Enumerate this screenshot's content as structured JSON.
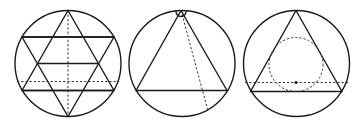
{
  "diagram": {
    "colors": {
      "stroke": "#1a1a1a",
      "background": "#ffffff"
    },
    "figures": [
      {
        "id": "hexagram-grid",
        "label": "Hexagram inscribed in circle with horizontal chords and dashed axes",
        "circle": {
          "cx": 68,
          "cy": 63.5,
          "r": 53
        },
        "up_triangle": [
          [
            68,
            10.5
          ],
          [
            22,
            90.5
          ],
          [
            114,
            90.5
          ]
        ],
        "down_triangle": [
          [
            68,
            116.5
          ],
          [
            22,
            37
          ],
          [
            114,
            37
          ]
        ],
        "solid_chords": [
          {
            "x1": 22,
            "y1": 37,
            "x2": 114,
            "y2": 37
          },
          {
            "x1": 38,
            "y1": 63.5,
            "x2": 98,
            "y2": 63.5
          },
          {
            "x1": 22,
            "y1": 90.5,
            "x2": 114,
            "y2": 90.5
          }
        ],
        "dashed_lines": [
          {
            "x1": 68,
            "y1": 10.5,
            "x2": 68,
            "y2": 116.5
          },
          {
            "x1": 17,
            "y1": 81.5,
            "x2": 119,
            "y2": 81.5
          }
        ]
      },
      {
        "id": "triangle-apex-angle",
        "label": "Triangle inscribed in circle with angle mark at apex and dashed line from apex",
        "circle": {
          "cx": 182,
          "cy": 63.5,
          "r": 53
        },
        "triangle": [
          [
            181,
            10.5
          ],
          [
            136,
            90.5
          ],
          [
            227,
            90.5
          ]
        ],
        "angle_mark": {
          "cx": 181,
          "cy": 10.5,
          "r": 5
        },
        "dashed_lines": [
          {
            "x1": 181,
            "y1": 10.5,
            "x2": 208,
            "y2": 111
          }
        ]
      },
      {
        "id": "triangle-incircle",
        "label": "Triangle inscribed in circle with dashed inscribed circle, dashed horizontal line and center point",
        "circle": {
          "cx": 296.5,
          "cy": 63.5,
          "r": 53
        },
        "triangle": [
          [
            296,
            10.5
          ],
          [
            250.5,
            91.5
          ],
          [
            342,
            91.5
          ]
        ],
        "incircle": {
          "cx": 296,
          "cy": 64.5,
          "r": 27
        },
        "dashed_lines": [
          {
            "x1": 245,
            "y1": 82.5,
            "x2": 348,
            "y2": 82.5
          }
        ],
        "center_point": {
          "cx": 296,
          "cy": 82.5,
          "r": 1.6
        }
      }
    ]
  }
}
